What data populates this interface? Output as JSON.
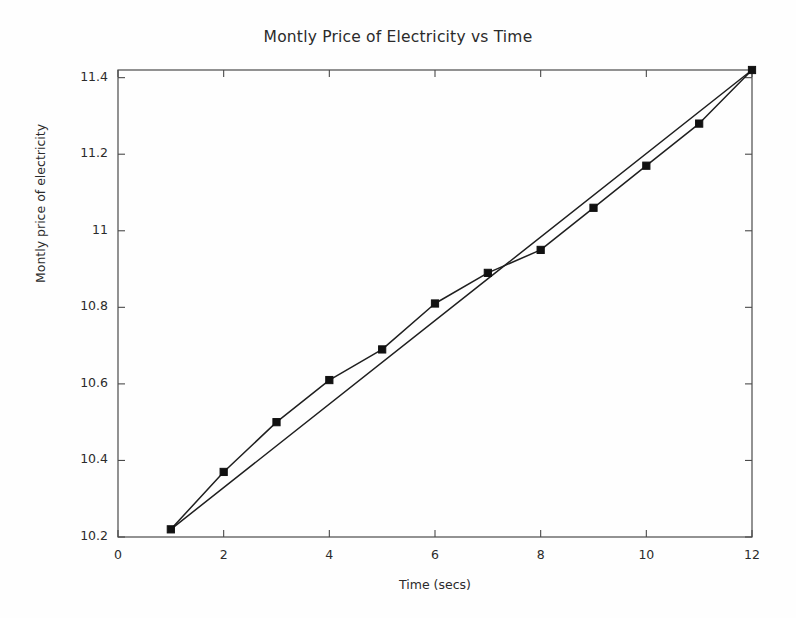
{
  "chart_data": {
    "type": "line",
    "title": "Montly Price of Electricity vs Time",
    "xlabel": "Time (secs)",
    "ylabel": "Montly price of electricity",
    "xlim": [
      0,
      12
    ],
    "ylim": [
      10.2,
      11.42
    ],
    "xticks": [
      0,
      2,
      4,
      6,
      8,
      10,
      12
    ],
    "xtick_labels": [
      "0",
      "2",
      "4",
      "6",
      "8",
      "10",
      "12"
    ],
    "yticks": [
      10.2,
      10.4,
      10.6,
      10.8,
      11.0,
      11.2,
      11.4
    ],
    "ytick_labels": [
      "10.2",
      "10.4",
      "10.6",
      "10.8",
      "11",
      "11.2",
      "11.4"
    ],
    "grid": false,
    "legend": "none",
    "x": [
      1,
      2,
      3,
      4,
      5,
      6,
      7,
      8,
      9,
      10,
      11,
      12
    ],
    "series": [
      {
        "name": "Monthly price of electricity",
        "marker": "filled-square",
        "x": [
          1,
          2,
          3,
          4,
          5,
          6,
          7,
          8,
          9,
          10,
          11,
          12
        ],
        "values": [
          10.22,
          10.37,
          10.5,
          10.61,
          10.69,
          10.81,
          10.89,
          10.95,
          11.06,
          11.17,
          11.28,
          11.42
        ]
      },
      {
        "name": "Straight trend line",
        "marker": "none",
        "x": [
          1,
          12
        ],
        "values": [
          10.22,
          11.42
        ]
      }
    ],
    "colors": {
      "line": "#1f1f1f",
      "marker": "#111111",
      "axis": "#4a4a4a",
      "background": "#fefefe"
    }
  },
  "figure": {
    "title": "Montly Price of Electricity vs Time",
    "x_axis_label": "Time (secs)",
    "y_axis_label": "Montly price of electricity"
  }
}
